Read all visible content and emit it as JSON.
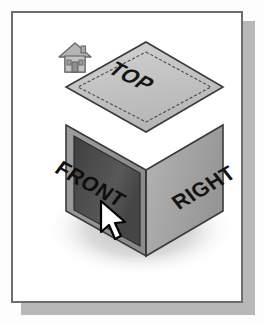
{
  "figure": {
    "kind": "viewcube-navigation-widget",
    "panel_background": "#ffffff",
    "panel_border_color": "#6e6e6e",
    "panel_shadow_color": "#b8b8b8",
    "page_background": "#fdfdfd"
  },
  "home": {
    "icon": "home-icon",
    "label": "Home",
    "color": "#9a9a9a",
    "outline": "#6a6a6a"
  },
  "cube": {
    "faces": [
      {
        "id": "top",
        "label": "TOP",
        "state": "normal",
        "fill": "#c3c3c3",
        "edge": "#4a4a4a",
        "text_color": "#1a1a1a"
      },
      {
        "id": "front",
        "label": "FRONT",
        "state": "highlighted",
        "fill": "#4e4e4e",
        "edge": "#2c2c2c",
        "text_color": "#111111"
      },
      {
        "id": "right",
        "label": "RIGHT",
        "state": "normal",
        "fill": "#a9a9a9",
        "edge": "#3d3d3d",
        "text_color": "#151515"
      }
    ],
    "shadow_color": "#c9c9c9"
  },
  "cursor": {
    "icon": "arrow-cursor",
    "label": "Pointer",
    "fill": "#ffffff",
    "outline": "#000000",
    "x": 86,
    "y": 186
  }
}
